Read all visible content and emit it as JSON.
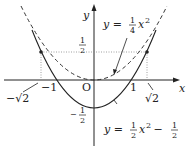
{
  "diagram": {
    "axes": {
      "x_label": "x",
      "y_label": "y",
      "origin_label": "O"
    },
    "x_ticks": {
      "neg_sqrt2": "−√2",
      "neg_one": "−1",
      "one": "1",
      "sqrt2": "√2"
    },
    "y_ticks": {
      "half_num": "1",
      "half_den": "2",
      "neg_half_sign": "−",
      "neg_half_num": "1",
      "neg_half_den": "2"
    },
    "curves": [
      {
        "name": "dashed parabola",
        "equation": "y = 1/4 x^2",
        "style": "dashed"
      },
      {
        "name": "solid parabola",
        "equation": "y = 1/2 x^2 − 1/2",
        "style": "solid"
      }
    ],
    "label_upper": {
      "prefix": "y = ",
      "num": "1",
      "den": "4",
      "var": "x",
      "exp": "2"
    },
    "label_lower": {
      "prefix": "y = ",
      "num1": "1",
      "den1": "2",
      "var": "x",
      "exp": "2",
      "minus": " − ",
      "num2": "1",
      "den2": "2"
    },
    "intersections": [
      "(−√2, 1/2)",
      "(√2, 1/2)"
    ]
  }
}
